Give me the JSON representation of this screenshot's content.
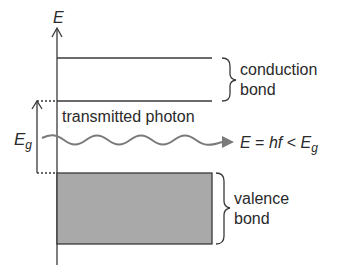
{
  "diagram": {
    "axis_label": "E",
    "conduction_band": {
      "line1": "conduction",
      "line2": "bond"
    },
    "valence_band": {
      "line1": "valence",
      "line2": "bond",
      "fill": "#a9a9a9"
    },
    "gap_label": {
      "main": "E",
      "sub": "g"
    },
    "photon_label": "transmitted photon",
    "equation": {
      "lhs": "E",
      "mid": " = ",
      "hf": "hf",
      "lt": " < ",
      "rhs": "E",
      "rhs_sub": "g"
    },
    "colors": {
      "line": "#3a3a3a",
      "wave": "#7a7a7a",
      "band_fill": "#a9a9a9"
    }
  }
}
